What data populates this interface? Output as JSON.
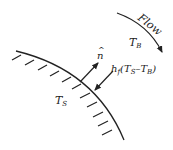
{
  "diagram": {
    "labels": {
      "flow": "Flow",
      "bulk_temp_main": "T",
      "bulk_temp_sub": "B",
      "surface_temp_main": "T",
      "surface_temp_sub": "S",
      "normal": "n",
      "normal_hat": "^",
      "flux_h": "h",
      "flux_h_sub": "f",
      "flux_open": "(T",
      "flux_s_sub": "S",
      "flux_minus": "–T",
      "flux_b_sub": "B",
      "flux_close": ")"
    },
    "colors": {
      "stroke": "#222222",
      "background": "#ffffff"
    }
  }
}
